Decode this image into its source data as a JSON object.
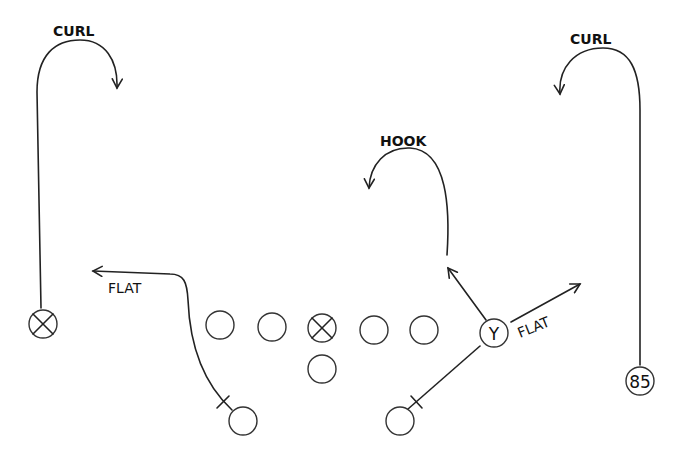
{
  "diagram": {
    "type": "football-play",
    "routes": [
      {
        "id": "left-wr",
        "label": "CURL",
        "symbol": "X"
      },
      {
        "id": "right-wr",
        "label": "CURL",
        "symbol": "85"
      },
      {
        "id": "tight-end-hook",
        "label": "HOOK",
        "symbol": "Y"
      },
      {
        "id": "tight-end-flat",
        "label": "FLAT",
        "symbol": "Y"
      },
      {
        "id": "left-back",
        "label": "FLAT",
        "symbol": ""
      }
    ],
    "labels": {
      "curl_left": "CURL",
      "curl_right": "CURL",
      "hook": "HOOK",
      "flat_left": "FLAT",
      "flat_right": "FLAT"
    },
    "players": {
      "left_receiver": "",
      "center_symbol": "",
      "tight_end": "Y",
      "right_receiver": "85"
    },
    "colors": {
      "ink": "#222222",
      "background": "#ffffff"
    }
  }
}
